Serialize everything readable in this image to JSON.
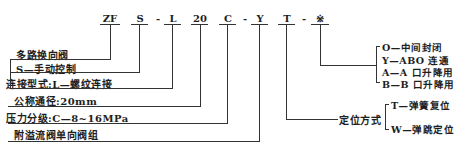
{
  "code": {
    "segments": [
      "ZF",
      "S",
      "-",
      "L",
      "20",
      "C",
      "-",
      "Y",
      "T",
      "-",
      "※"
    ]
  },
  "labels": {
    "type": "多路换向阀",
    "control": "S—手动控制",
    "connection": "连接型式:L—螺纹连接",
    "nominal_diameter": "公称通径:20mm",
    "pressure": "压力分级:C—8~16MPa",
    "valve_group": "附溢流阀单向阀组"
  },
  "positioning": {
    "title": "定位方式",
    "options": [
      "T—弹簧复位",
      "W—弹跳定位"
    ]
  },
  "function": {
    "options": [
      "O—中间封闭",
      "Y—ABO 连通",
      "A—A 口升降用",
      "B—B 口升降用"
    ]
  }
}
